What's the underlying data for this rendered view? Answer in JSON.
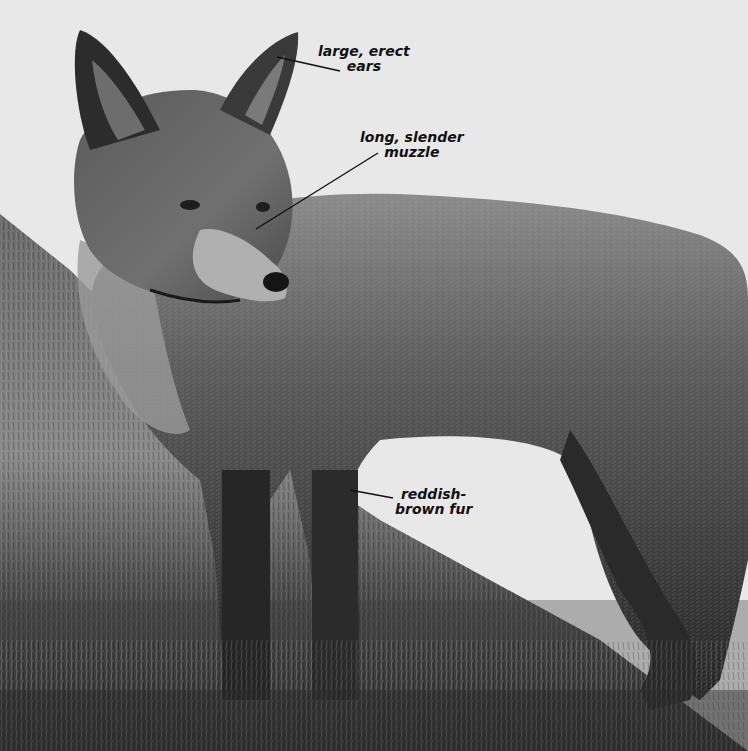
{
  "image": {
    "subject": "red fox (grayscale photo)",
    "background": "grass and leaves, white cut-out area"
  },
  "annotations": [
    {
      "id": "ears",
      "lines": [
        "large, erect",
        "ears"
      ]
    },
    {
      "id": "muzzle",
      "lines": [
        "long, slender",
        "muzzle"
      ]
    },
    {
      "id": "fur",
      "lines": [
        "reddish-",
        "brown fur"
      ]
    }
  ],
  "colors": {
    "paper": "#e8e8e8",
    "text": "#111111",
    "leader_line": "#111111"
  }
}
